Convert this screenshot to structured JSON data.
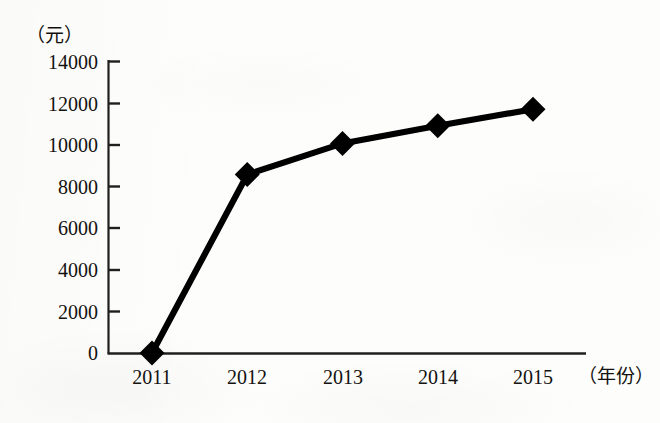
{
  "chart_data": {
    "type": "line",
    "title": "",
    "subtitle": "",
    "xlabel": "（年份）",
    "ylabel": "（元）",
    "categories": [
      "2011",
      "2012",
      "2013",
      "2014",
      "2015"
    ],
    "values": [
      0,
      8600,
      10100,
      10950,
      11750
    ],
    "series": [
      {
        "name": "",
        "values": [
          0,
          8600,
          10100,
          10950,
          11750
        ]
      }
    ],
    "ylim": [
      0,
      14000
    ],
    "yticks": [
      "0",
      "2000",
      "4000",
      "6000",
      "8000",
      "10000",
      "12000",
      "14000"
    ],
    "ytick_values": [
      0,
      2000,
      4000,
      6000,
      8000,
      10000,
      12000,
      14000
    ],
    "xticks": [
      "2011",
      "2012",
      "2013",
      "2014",
      "2015"
    ],
    "grid": false,
    "legend": null,
    "legend_position": "none",
    "marker": "diamond",
    "line_color": "#000000",
    "marker_color": "#000000",
    "axis_color": "#1a1a1a",
    "background_color": "#fdfdfb",
    "annotations": []
  },
  "axis": {
    "y_unit": "（元）",
    "x_unit": "（年份）"
  }
}
